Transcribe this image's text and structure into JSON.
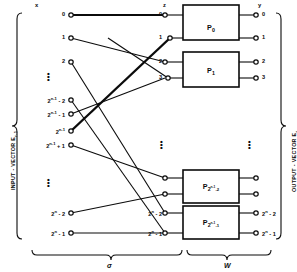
{
  "figure": {
    "type": "interconnection-network-diagram",
    "header_labels": {
      "input": "x",
      "middle": "z",
      "output": "y"
    },
    "side_labels": {
      "left": "INPUT - VECTOR E",
      "left_sub": "r-1",
      "right": "OUTPUT - VECTOR E",
      "right_sub": "r"
    },
    "braces": [
      {
        "name": "permutation-stage",
        "label": "σ"
      },
      {
        "name": "processing-stage",
        "label": "W"
      }
    ],
    "input_nodes": [
      {
        "id": "in0",
        "label": "0",
        "sup": "",
        "y": 15
      },
      {
        "id": "in1",
        "label": "1",
        "sup": "",
        "y": 38
      },
      {
        "id": "in2",
        "label": "2",
        "sup": "",
        "y": 62
      },
      {
        "id": "in3",
        "label": "2",
        "sup": "n-1",
        "suffix": "- 2",
        "y": 100
      },
      {
        "id": "in4",
        "label": "2",
        "sup": "n-1",
        "suffix": "- 1",
        "y": 114
      },
      {
        "id": "in5",
        "label": "2",
        "sup": "n-1",
        "suffix": "",
        "y": 131
      },
      {
        "id": "in6",
        "label": "2",
        "sup": "n-1",
        "suffix": "+ 1",
        "y": 145
      },
      {
        "id": "in7",
        "label": "2",
        "sup": "n",
        "suffix": "- 2",
        "y": 213
      },
      {
        "id": "in8",
        "label": "2",
        "sup": "n",
        "suffix": "- 1",
        "y": 233
      }
    ],
    "middle_nodes": [
      {
        "id": "z0",
        "label": "0",
        "sup": "",
        "suffix": "",
        "y": 15
      },
      {
        "id": "z1",
        "label": "1",
        "sup": "",
        "suffix": "",
        "y": 38
      },
      {
        "id": "z2",
        "label": "2",
        "sup": "",
        "suffix": "",
        "y": 62
      },
      {
        "id": "z3",
        "label": "3",
        "sup": "",
        "suffix": "",
        "y": 78
      },
      {
        "id": "z4",
        "label": "",
        "sup": "",
        "suffix": "",
        "y": 178
      },
      {
        "id": "z5",
        "label": "",
        "sup": "",
        "suffix": "",
        "y": 194
      },
      {
        "id": "z6",
        "label": "2",
        "sup": "n",
        "suffix": "- 2",
        "y": 213
      },
      {
        "id": "z7",
        "label": "2",
        "sup": "n",
        "suffix": "- 1",
        "y": 233
      }
    ],
    "output_nodes": [
      {
        "id": "y0",
        "label": "0",
        "sup": "",
        "suffix": "",
        "y": 15
      },
      {
        "id": "y1",
        "label": "1",
        "sup": "",
        "suffix": "",
        "y": 38
      },
      {
        "id": "y2",
        "label": "2",
        "sup": "",
        "suffix": "",
        "y": 62
      },
      {
        "id": "y3",
        "label": "3",
        "sup": "",
        "suffix": "",
        "y": 78
      },
      {
        "id": "y4",
        "label": "",
        "sup": "",
        "suffix": "",
        "y": 178
      },
      {
        "id": "y5",
        "label": "",
        "sup": "",
        "suffix": "",
        "y": 194
      },
      {
        "id": "y6",
        "label": "2",
        "sup": "n",
        "suffix": "- 2",
        "y": 213
      },
      {
        "id": "y7",
        "label": "2",
        "sup": "n",
        "suffix": "- 1",
        "y": 233
      }
    ],
    "processors": [
      {
        "id": "p0",
        "label": "P",
        "sub": "0",
        "sub2": "",
        "y": 12,
        "h": 34
      },
      {
        "id": "p1",
        "label": "P",
        "sub": "1",
        "sub2": "",
        "y": 55,
        "h": 34
      },
      {
        "id": "p2",
        "label": "P",
        "sub": "2",
        "sup": "n-1",
        "sub2": "2",
        "y": 172,
        "h": 32
      },
      {
        "id": "p3",
        "label": "P",
        "sub": "2",
        "sup": "n-1",
        "sub2": "1",
        "y": 208,
        "h": 32
      }
    ],
    "ellipses": [
      {
        "name": "input-ellipsis-top",
        "x": 47,
        "y": 72
      },
      {
        "name": "input-ellipsis-middle",
        "x": 47,
        "y": 178
      },
      {
        "name": "middle-ellipsis",
        "x": 160,
        "y": 140
      },
      {
        "name": "output-ellipsis",
        "x": 248,
        "y": 140
      }
    ],
    "colors": {
      "ink": "#0b0b0b",
      "paper": "#ffffff"
    }
  }
}
